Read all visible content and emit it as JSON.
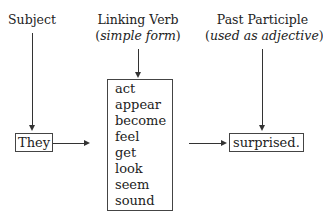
{
  "columns": [
    {
      "title": "Subject"
    },
    {
      "title": "Linking Verb",
      "subtitle": "simple form"
    },
    {
      "title": "Past Participle",
      "subtitle": "used as adjective"
    }
  ],
  "subject_box": "They",
  "verbs": [
    "act",
    "appear",
    "become",
    "feel",
    "get",
    "look",
    "seem",
    "sound"
  ],
  "participle_box": "surprised."
}
